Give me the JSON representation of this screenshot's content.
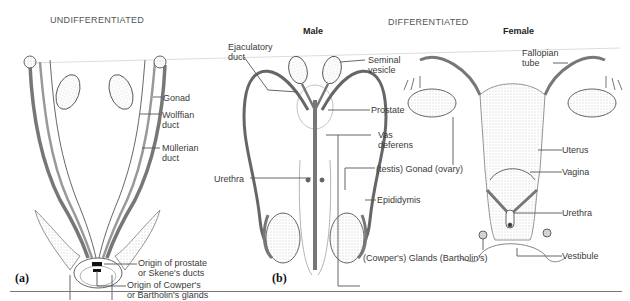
{
  "headers": {
    "undifferentiated": "UNDIFFERENTIATED",
    "differentiated": "DIFFERENTIATED",
    "male": "Male",
    "female": "Female"
  },
  "panels": {
    "a": "(a)",
    "b": "(b)"
  },
  "labels_a": {
    "gonad": "Gonad",
    "wolffian": "Wolffian\nduct",
    "mullerian": "Müllerian\nduct",
    "prostate_origin": "Origin of prostate\nor Skene's ducts",
    "cowper_origin": "Origin of Cowper's\nor Bartholin's glands"
  },
  "labels_male": {
    "ejaculatory": "Ejaculatory\nduct",
    "seminal": "Seminal\nvesicle",
    "prostate": "Prostate",
    "vas": "Vas\ndeferens",
    "urethra": "Urethra",
    "gonad": "(testis) Gonad (ovary)",
    "epididymis": "Epididymis",
    "glands": "(Cowper's) Glands (Bartholin's)"
  },
  "labels_female": {
    "fallopian": "Fallopian\ntube",
    "uterus": "Uterus",
    "vagina": "Vagina",
    "urethra": "Urethra",
    "vestibule": "Vestibule"
  }
}
